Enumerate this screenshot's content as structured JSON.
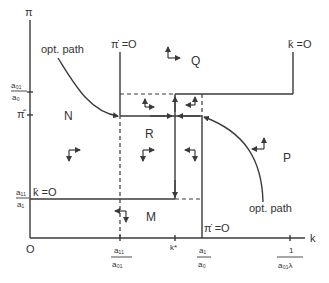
{
  "axes": {
    "y_label": "π",
    "x_label": "k",
    "origin_label": "O"
  },
  "y_ticks": {
    "a01_over_a0": {
      "num": "a₀₁",
      "den": "a₀"
    },
    "pi_hat": "π̂",
    "a11_over_a1": {
      "num": "a₁₁",
      "den": "a₁"
    }
  },
  "x_ticks": {
    "a11_over_a01": {
      "num": "a₁₁",
      "den": "a₀₁"
    },
    "k_star": "k*",
    "a1_over_a0": {
      "num": "a₁",
      "den": "a₀"
    },
    "inv_a01_lambda": {
      "num": "1",
      "den": "a₀₁λ"
    }
  },
  "curves": {
    "pi_dot_zero_top": "π̇ =O",
    "pi_dot_zero_bottom": "π̇ =O",
    "k_dot_zero_right": "k̇ =O",
    "k_dot_zero_left": "k̇ =O",
    "opt_path_left": "opt. path",
    "opt_path_right": "opt. path"
  },
  "regions": {
    "N": "N",
    "Q": "Q",
    "R": "R",
    "P": "P",
    "M": "M"
  }
}
